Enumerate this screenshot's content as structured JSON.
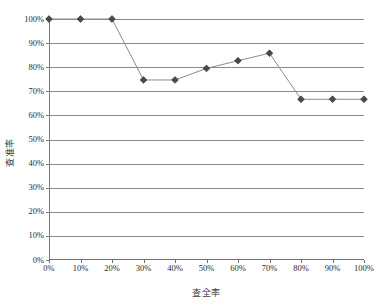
{
  "chart_data": {
    "type": "line",
    "title": "",
    "subtitle": "",
    "xlabel": "查全率",
    "ylabel": "查准率",
    "x": [
      0,
      10,
      20,
      30,
      40,
      50,
      60,
      70,
      80,
      90,
      100
    ],
    "categories": [
      "0%",
      "10%",
      "20%",
      "30%",
      "40%",
      "50%",
      "60%",
      "70%",
      "80%",
      "90%",
      "100%"
    ],
    "values": [
      100,
      100,
      100,
      74.7,
      74.7,
      79.5,
      82.7,
      85.8,
      66.7,
      66.7,
      66.7
    ],
    "series": [
      {
        "name": "",
        "values": [
          100,
          100,
          100,
          74.7,
          74.7,
          79.5,
          82.7,
          85.8,
          66.7,
          66.7,
          66.7
        ]
      }
    ],
    "xlim": [
      0,
      100
    ],
    "ylim": [
      0,
      100
    ],
    "x_ticks": [
      0,
      10,
      20,
      30,
      40,
      50,
      60,
      70,
      80,
      90,
      100
    ],
    "y_ticks": [
      0,
      10,
      20,
      30,
      40,
      50,
      60,
      70,
      80,
      90,
      100
    ],
    "x_tick_labels": [
      "0%",
      "10%",
      "20%",
      "30%",
      "40%",
      "50%",
      "60%",
      "70%",
      "80%",
      "90%",
      "100%"
    ],
    "y_tick_labels": [
      "0%",
      "10%",
      "20%",
      "30%",
      "40%",
      "50%",
      "60%",
      "70%",
      "80%",
      "90%",
      "100%"
    ],
    "grid": "horizontal",
    "legend": "none",
    "marker": "diamond",
    "colors": {
      "line": "#8b8b8b",
      "marker_fill": "#4a4a4a",
      "marker_stroke": "#2e2e2e",
      "gridline": "#8a8a8a",
      "axis": "#6f6f6f",
      "background": "#ffffff",
      "text": "#2b2b2b"
    }
  }
}
